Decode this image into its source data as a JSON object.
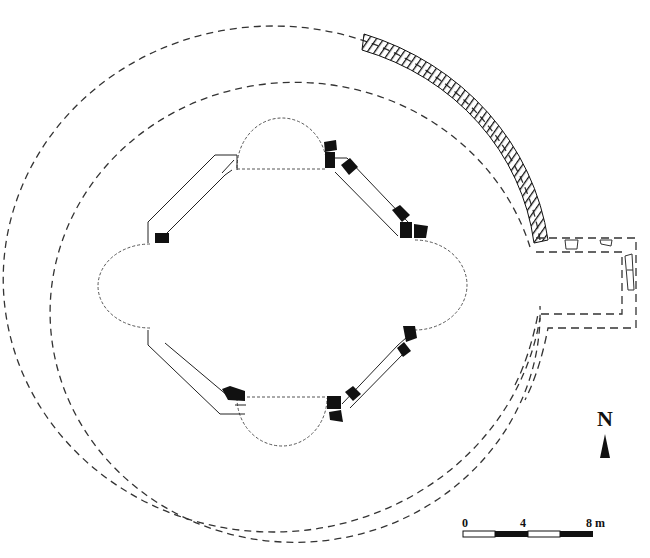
{
  "figure": {
    "type": "architectural ground plan",
    "line_color": "#222222",
    "fill_color": "#111111",
    "background": "#ffffff"
  },
  "north_arrow": {
    "label": "N"
  },
  "scale_bar": {
    "labels": [
      "0",
      "4",
      "8 m"
    ],
    "unit": "m",
    "segments": [
      "white",
      "black",
      "white",
      "black"
    ],
    "max_value": 8
  },
  "legend": {
    "solid_black": "surviving masonry",
    "hatched": "preserved outer wall segment",
    "dashed": "reconstructed / conjectural wall line"
  }
}
